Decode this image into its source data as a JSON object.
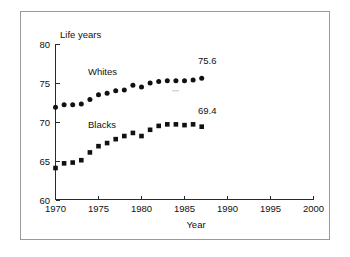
{
  "chart_data": {
    "type": "scatter",
    "title": "",
    "subtitle": "",
    "xlabel": "Year",
    "ylabel": "Life years",
    "xlim": [
      1970,
      2000
    ],
    "ylim": [
      60,
      80
    ],
    "xticks": [
      1970,
      1975,
      1980,
      1985,
      1990,
      1995,
      2000
    ],
    "xticklabels": [
      "1970",
      "1975",
      "1980",
      "1985",
      "1990",
      "1995",
      "2000"
    ],
    "yticks": [
      60,
      65,
      70,
      75,
      80
    ],
    "yticklabels": [
      "60",
      "65",
      "70",
      "75",
      "80"
    ],
    "grid": false,
    "legend": "inline-series-labels",
    "x": [
      1970,
      1971,
      1972,
      1973,
      1974,
      1975,
      1976,
      1977,
      1978,
      1979,
      1980,
      1981,
      1982,
      1983,
      1984,
      1985,
      1986,
      1987
    ],
    "series": [
      {
        "name": "Whites",
        "marker": "circle",
        "color": "#111111",
        "values": [
          71.9,
          72.2,
          72.2,
          72.3,
          72.9,
          73.5,
          73.7,
          74.0,
          74.1,
          74.7,
          74.5,
          75.0,
          75.2,
          75.3,
          75.3,
          75.3,
          75.4,
          75.6
        ]
      },
      {
        "name": "Blacks",
        "marker": "square",
        "color": "#111111",
        "values": [
          64.1,
          64.7,
          64.8,
          65.1,
          66.1,
          66.9,
          67.3,
          67.8,
          68.2,
          68.6,
          68.2,
          69.0,
          69.5,
          69.7,
          69.7,
          69.6,
          69.7,
          69.4
        ]
      }
    ],
    "annotations": [
      {
        "text": "75.6",
        "series": "Whites",
        "x": 1987,
        "y": 75.6
      },
      {
        "text": "69.4",
        "series": "Blacks",
        "x": 1987,
        "y": 69.4
      },
      {
        "text": "Whites",
        "series": "Whites",
        "x": 1975.1,
        "y": 76.2
      },
      {
        "text": "Blacks",
        "series": "Blacks",
        "x": 1975.1,
        "y": 70.1
      }
    ]
  },
  "axes": {
    "y_axis_title": "Life years",
    "x_axis_title": "Year"
  }
}
